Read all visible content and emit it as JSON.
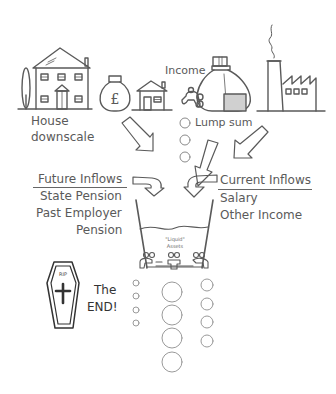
{
  "diagram": {
    "icons": {
      "large_house": "large-house-icon",
      "money_bag_pound": "pound-money-bag-icon",
      "small_house": "small-house-icon",
      "income_sack": "income-sack-with-tap-icon",
      "factory": "factory-icon",
      "bucket": "liquid-assets-bucket-icon",
      "coffin": "rip-coffin-icon"
    },
    "labels": {
      "house_downscale_line1": "House",
      "house_downscale_line2": "downscale",
      "income": "Income",
      "lump_sum": "Lump sum",
      "future_inflows": {
        "heading": "Future Inflows",
        "items": [
          "State Pension",
          "Past Employer",
          "Pension"
        ]
      },
      "current_inflows": {
        "heading": "Current Inflows",
        "items": [
          "Salary",
          "Other Income"
        ]
      },
      "bucket_line1": "\"Liquid\"",
      "bucket_line2": "Assets",
      "coffin_text": "RIP",
      "the_end_line1": "The",
      "the_end_line2": "END!"
    },
    "colors": {
      "line": "#5a5a5a",
      "text": "#5a5a5a",
      "fill_grey": "#d0d0d0",
      "drops": "#9a9a9a",
      "coffin": "#333333"
    }
  }
}
